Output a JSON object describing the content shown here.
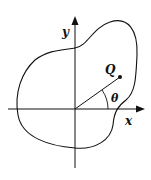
{
  "diagram": {
    "axes": {
      "x_label": "x",
      "y_label": "y"
    },
    "point": {
      "label": "Q"
    },
    "angle": {
      "label": "θ"
    },
    "colors": {
      "stroke": "#111111",
      "background": "#ffffff"
    }
  }
}
